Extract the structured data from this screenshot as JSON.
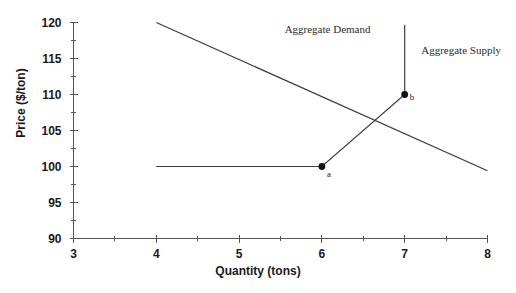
{
  "chart_data": {
    "type": "line",
    "title": "",
    "xlabel": "Quantity (tons)",
    "ylabel": "Price ($/ton)",
    "xlim": [
      3,
      8
    ],
    "ylim": [
      90,
      120
    ],
    "xticks": [
      3,
      4,
      5,
      6,
      7,
      8
    ],
    "xtick_labels": [
      "3",
      "4",
      "5",
      "6",
      "7",
      "8"
    ],
    "yticks": [
      90,
      95,
      100,
      105,
      110,
      115,
      120
    ],
    "ytick_labels": [
      "90",
      "95",
      "100",
      "105",
      "110",
      "115",
      "120"
    ],
    "x_minor_step": 0.5,
    "y_minor_step": 2.5,
    "grid": false,
    "legend": "inline-annotations",
    "series": [
      {
        "name": "Aggregate Demand",
        "label": "Aggregate Demand",
        "label_x": 5.55,
        "label_y": 119.1,
        "points": [
          {
            "x": 4.0,
            "y": 120.0
          },
          {
            "x": 8.0,
            "y": 99.4
          }
        ]
      },
      {
        "name": "Aggregate Supply",
        "label": "Aggregate Supply",
        "label_x": 7.2,
        "label_y": 116.2,
        "points": [
          {
            "x": 4.0,
            "y": 100.0
          },
          {
            "x": 6.0,
            "y": 100.0
          },
          {
            "x": 7.0,
            "y": 110.0
          },
          {
            "x": 7.0,
            "y": 119.7
          }
        ]
      }
    ],
    "markers": [
      {
        "label": "a",
        "x": 6.0,
        "y": 100.0
      },
      {
        "label": "b",
        "x": 7.0,
        "y": 110.0
      }
    ],
    "colors": {
      "line": "#3c3c3c",
      "axis": "#555555",
      "marker": "#111111",
      "text": "#1a1a1a"
    }
  }
}
